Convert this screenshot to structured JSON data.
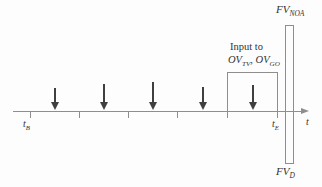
{
  "diagram": {
    "labels": {
      "fv_noa_main": "FV",
      "fv_noa_sub": "NOA",
      "fv_d_main": "FV",
      "fv_d_sub": "D",
      "input_line": "Input to",
      "ov_tv_main": "OV",
      "ov_tv_sub": "TV",
      "ov_sep": ", ",
      "ov_go_main": "OV",
      "ov_go_sub": "GO",
      "t_b_main": "t",
      "t_b_sub": "B",
      "t_e_main": "t",
      "t_e_sub": "E",
      "axis_label": "t"
    },
    "arrows": {
      "count": 5
    },
    "colors": {
      "background": "#fdfdfd",
      "line": "#8e8e8e",
      "arrow": "#3f3f3f",
      "text": "#323232"
    }
  }
}
